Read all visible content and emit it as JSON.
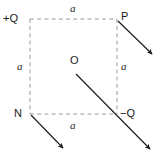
{
  "figure": {
    "canvas": {
      "width": 163,
      "height": 158
    },
    "colors": {
      "background": "#ffffff",
      "dashed_line": "#9a9a9a",
      "arrow": "#1a1a1a",
      "text": "#1a1a1a"
    },
    "vertices": [
      {
        "key": "top_left",
        "label": "+Q",
        "x": 30,
        "y": 19,
        "label_x": 3,
        "label_y": 13
      },
      {
        "key": "top_right",
        "label": "P",
        "x": 117,
        "y": 19,
        "label_x": 121,
        "label_y": 11
      },
      {
        "key": "bottom_left",
        "label": "N",
        "x": 30,
        "y": 114,
        "label_x": 14,
        "label_y": 110
      },
      {
        "key": "bottom_right",
        "label": "−Q",
        "x": 117,
        "y": 114,
        "label_x": 120,
        "label_y": 109
      }
    ],
    "center_point": {
      "key": "origin",
      "label": "O",
      "x": 74,
      "y": 68,
      "label_x": 70,
      "label_y": 55
    },
    "side_labels": [
      {
        "key": "top",
        "label": "a",
        "x": 70,
        "y": 3
      },
      {
        "key": "left",
        "label": "a",
        "x": 17,
        "y": 61
      },
      {
        "key": "right",
        "label": "a",
        "x": 121,
        "y": 61
      },
      {
        "key": "bottom",
        "label": "a",
        "x": 70,
        "y": 120
      }
    ],
    "dashed_edges": [
      {
        "key": "edge-top",
        "x1": 30,
        "y1": 19,
        "x2": 117,
        "y2": 19
      },
      {
        "key": "edge-right",
        "x1": 117,
        "y1": 19,
        "x2": 117,
        "y2": 114
      },
      {
        "key": "edge-bottom",
        "x1": 30,
        "y1": 114,
        "x2": 117,
        "y2": 114
      },
      {
        "key": "edge-left",
        "x1": 30,
        "y1": 19,
        "x2": 30,
        "y2": 114
      }
    ],
    "arrows": [
      {
        "key": "field-vector-at-P",
        "from": "P",
        "x1": 118,
        "y1": 21,
        "x2": 154,
        "y2": 56
      },
      {
        "key": "field-vector-at-N",
        "from": "N",
        "x1": 31,
        "y1": 115,
        "x2": 65,
        "y2": 150
      },
      {
        "key": "field-vector-from-O-through-minusQ",
        "from": "O",
        "x1": 76,
        "y1": 74,
        "x2": 152,
        "y2": 151
      }
    ]
  }
}
